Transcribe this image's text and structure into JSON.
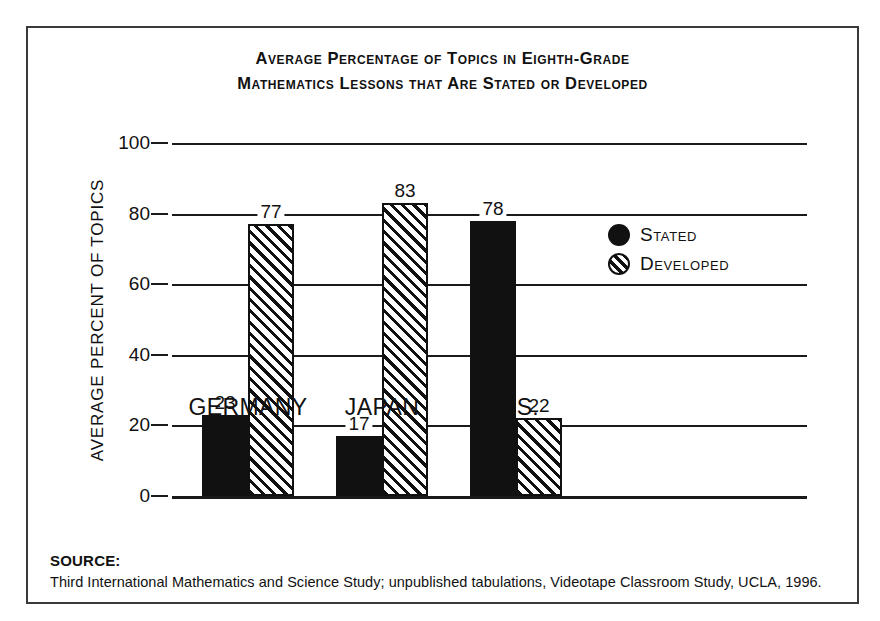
{
  "title": {
    "line1": "Average Percentage of Topics in Eighth-Grade",
    "line2": "Mathematics Lessons that Are Stated or Developed"
  },
  "legend": {
    "items": [
      {
        "label": "Stated",
        "marker": "filled-circle-icon"
      },
      {
        "label": "Developed",
        "marker": "hatched-circle-icon"
      }
    ]
  },
  "source": {
    "heading": "SOURCE:",
    "text": "Third International Mathematics and Science Study; unpublished tabulations, Videotape Classroom Study, UCLA, 1996."
  },
  "chart_data": {
    "type": "bar",
    "title": "Average Percentage of Topics in Eighth-Grade Mathematics Lessons that Are Stated or Developed",
    "xlabel": "",
    "ylabel": "AVERAGE PERCENT OF TOPICS",
    "ylim": [
      0,
      100
    ],
    "yticks": [
      0,
      20,
      40,
      60,
      80,
      100
    ],
    "ytick_labels": [
      "0",
      "20",
      "40",
      "60",
      "80",
      "100"
    ],
    "grid": true,
    "legend_position": "center-right",
    "categories": [
      "GERMANY",
      "JAPAN",
      "U.S."
    ],
    "series": [
      {
        "name": "Stated",
        "values": [
          23,
          17,
          78
        ]
      },
      {
        "name": "Developed",
        "values": [
          77,
          83,
          22
        ]
      }
    ],
    "value_labels": {
      "GERMANY": {
        "Stated": "23",
        "Developed": "77"
      },
      "JAPAN": {
        "Stated": "17",
        "Developed": "83"
      },
      "U.S.": {
        "Stated": "78",
        "Developed": "22"
      }
    }
  }
}
